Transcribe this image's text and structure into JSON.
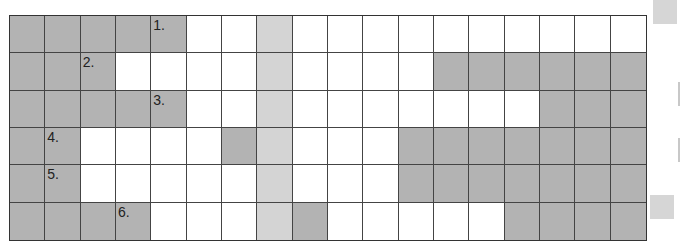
{
  "puzzle": {
    "rows": 6,
    "cols": 18,
    "colors": {
      "dark": "#b3b3b3",
      "light": "#d4d4d4",
      "white": "#ffffff",
      "border": "#444444"
    },
    "solution_column": 7,
    "grid": [
      [
        "d",
        "d",
        "d",
        "d",
        "d",
        "w",
        "w",
        "l",
        "w",
        "w",
        "w",
        "w",
        "w",
        "w",
        "w",
        "w",
        "w",
        "w"
      ],
      [
        "d",
        "d",
        "d",
        "w",
        "w",
        "w",
        "w",
        "l",
        "w",
        "w",
        "w",
        "w",
        "d",
        "d",
        "d",
        "d",
        "d",
        "d"
      ],
      [
        "d",
        "d",
        "d",
        "d",
        "d",
        "w",
        "w",
        "l",
        "w",
        "w",
        "w",
        "w",
        "w",
        "w",
        "w",
        "d",
        "d",
        "d"
      ],
      [
        "d",
        "d",
        "w",
        "w",
        "w",
        "w",
        "d",
        "l",
        "w",
        "w",
        "w",
        "d",
        "d",
        "d",
        "d",
        "d",
        "d",
        "d"
      ],
      [
        "d",
        "d",
        "w",
        "w",
        "w",
        "w",
        "w",
        "l",
        "w",
        "w",
        "w",
        "d",
        "d",
        "d",
        "d",
        "d",
        "d",
        "d"
      ],
      [
        "d",
        "d",
        "d",
        "d",
        "w",
        "w",
        "w",
        "l",
        "d",
        "w",
        "w",
        "w",
        "w",
        "w",
        "d",
        "d",
        "d",
        "d"
      ]
    ],
    "clues": [
      {
        "row": 0,
        "col": 4,
        "label": "1."
      },
      {
        "row": 1,
        "col": 2,
        "label": "2."
      },
      {
        "row": 2,
        "col": 4,
        "label": "3."
      },
      {
        "row": 3,
        "col": 1,
        "label": "4."
      },
      {
        "row": 4,
        "col": 1,
        "label": "5."
      },
      {
        "row": 5,
        "col": 3,
        "label": "6."
      }
    ]
  },
  "legend": {
    "top_swatch_color": "#d6d6d6",
    "bottom_swatch_color": "#d6d6d6"
  }
}
